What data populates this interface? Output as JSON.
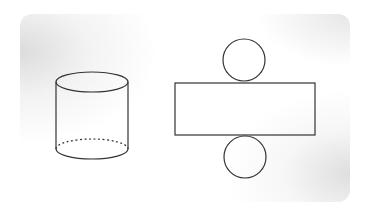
{
  "diagram": {
    "title": "",
    "colors": {
      "stroke": "#333333",
      "background": "#ffffff",
      "frame_shadow": "#dcdcdc"
    },
    "cylinder": {
      "label": "",
      "top_ellipse": {
        "cx": 92,
        "cy": 82,
        "rx": 36,
        "ry": 10
      },
      "bottom_ellipse": {
        "cx": 92,
        "cy": 149,
        "rx": 36,
        "ry": 10
      },
      "hidden_edge": "dashed"
    },
    "net": {
      "top_circle": {
        "cx": 244,
        "cy": 60,
        "r": 21
      },
      "rectangle": {
        "x": 175,
        "y": 83,
        "width": 140,
        "height": 52
      },
      "bottom_circle": {
        "cx": 245,
        "cy": 157,
        "r": 21
      }
    }
  }
}
